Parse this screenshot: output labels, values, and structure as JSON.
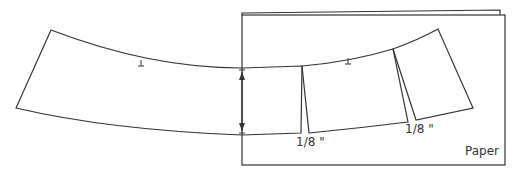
{
  "diagram": {
    "labels": {
      "slit1": "1/8 \"",
      "slit2": "1/8 \"",
      "paper": "Paper"
    },
    "colors": {
      "stroke": "#333333",
      "background": "#ffffff"
    }
  }
}
